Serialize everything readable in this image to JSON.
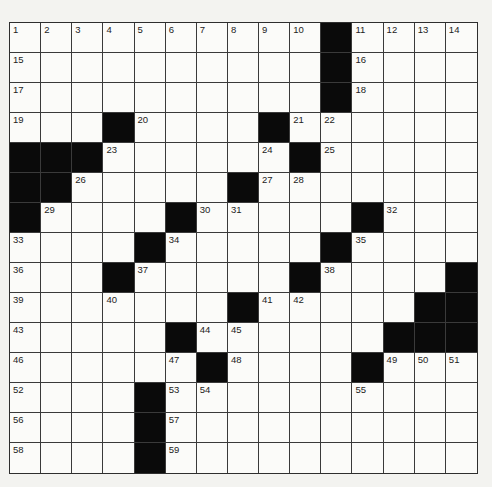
{
  "puzzle": {
    "rows": 15,
    "cols": 15,
    "colors": {
      "background": "#f3f3f0",
      "cell": "#fbfbf9",
      "block": "#0a0a0a",
      "line": "#3a3a3a",
      "number": "#222222"
    },
    "grid": [
      [
        "1",
        "2",
        "3",
        "4",
        "5",
        "6",
        "7",
        "8",
        "9",
        "10",
        "#",
        "11",
        "12",
        "13",
        "14"
      ],
      [
        "15",
        "",
        "",
        "",
        "",
        "",
        "",
        "",
        "",
        "",
        "#",
        "16",
        "",
        "",
        ""
      ],
      [
        "17",
        "",
        "",
        "",
        "",
        "",
        "",
        "",
        "",
        "",
        "#",
        "18",
        "",
        "",
        ""
      ],
      [
        "19",
        "",
        "",
        "#",
        "20",
        "",
        "",
        "",
        "#",
        "21",
        "22",
        "",
        "",
        "",
        ""
      ],
      [
        "#",
        "#",
        "#",
        "23",
        "",
        "",
        "",
        "",
        "24",
        "#",
        "25",
        "",
        "",
        "",
        ""
      ],
      [
        "#",
        "#",
        "26",
        "",
        "",
        "",
        "",
        "#",
        "27",
        "28",
        "",
        "",
        "",
        "",
        ""
      ],
      [
        "#",
        "29",
        "",
        "",
        "",
        "#",
        "30",
        "31",
        "",
        "",
        "",
        "#",
        "32",
        "",
        ""
      ],
      [
        "33",
        "",
        "",
        "",
        "#",
        "34",
        "",
        "",
        "",
        "",
        "#",
        "35",
        "",
        "",
        ""
      ],
      [
        "36",
        "",
        "",
        "#",
        "37",
        "",
        "",
        "",
        "",
        "#",
        "38",
        "",
        "",
        "",
        "#"
      ],
      [
        "39",
        "",
        "",
        "40",
        "",
        "",
        "",
        "#",
        "41",
        "42",
        "",
        "",
        "",
        "#",
        "#"
      ],
      [
        "43",
        "",
        "",
        "",
        "",
        "#",
        "44",
        "45",
        "",
        "",
        "",
        "",
        "#",
        "#",
        "#"
      ],
      [
        "46",
        "",
        "",
        "",
        "",
        "47",
        "#",
        "48",
        "",
        "",
        "",
        "#",
        "49",
        "50",
        "51"
      ],
      [
        "52",
        "",
        "",
        "",
        "#",
        "53",
        "54",
        "",
        "",
        "",
        "",
        "55",
        "",
        "",
        ""
      ],
      [
        "56",
        "",
        "",
        "",
        "#",
        "57",
        "",
        "",
        "",
        "",
        "",
        "",
        "",
        "",
        ""
      ],
      [
        "58",
        "",
        "",
        "",
        "#",
        "59",
        "",
        "",
        "",
        "",
        "",
        "",
        "",
        "",
        ""
      ]
    ]
  }
}
